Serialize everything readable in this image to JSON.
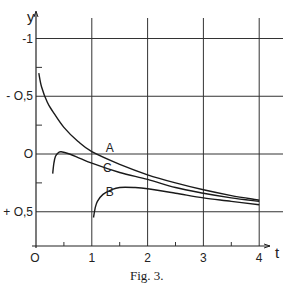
{
  "chart_data": {
    "type": "line",
    "title": "",
    "caption": "Fig. 3.",
    "xlabel": "t",
    "ylabel": "y",
    "xlim": [
      0,
      4
    ],
    "ylim": [
      -1,
      0.5
    ],
    "y_inverted": true,
    "grid": true,
    "x_ticks": [
      0,
      1,
      2,
      3,
      4
    ],
    "x_tick_labels": [
      "O",
      "1",
      "2",
      "3",
      "4"
    ],
    "x_minor_ticks": [
      0.5,
      1.5,
      2.5,
      3.5
    ],
    "y_ticks": [
      -1,
      -0.5,
      0,
      0.5
    ],
    "y_tick_labels": [
      "-1",
      "- O,5",
      "O",
      "+ O,5"
    ],
    "y_minor_ticks": [
      -0.75,
      -0.25,
      0.25
    ],
    "series": [
      {
        "name": "A",
        "x": [
          0.05,
          0.1,
          0.2,
          0.3,
          0.5,
          0.75,
          1.0,
          1.5,
          2.0,
          2.5,
          3.0,
          3.5,
          4.0
        ],
        "y": [
          -0.7,
          -0.58,
          -0.45,
          -0.37,
          -0.23,
          -0.11,
          -0.02,
          0.09,
          0.18,
          0.25,
          0.31,
          0.36,
          0.4
        ]
      },
      {
        "name": "C",
        "x": [
          0.3,
          0.32,
          0.35,
          0.4,
          0.45,
          0.6,
          0.8,
          1.0,
          1.5,
          2.0,
          2.5,
          3.0,
          3.5,
          4.0
        ],
        "y": [
          0.17,
          0.08,
          0.02,
          -0.01,
          -0.02,
          0.0,
          0.04,
          0.08,
          0.16,
          0.22,
          0.29,
          0.34,
          0.38,
          0.41
        ]
      },
      {
        "name": "B",
        "x": [
          1.03,
          1.06,
          1.1,
          1.2,
          1.35,
          1.5,
          1.75,
          2.0,
          2.5,
          3.0,
          3.5,
          4.0
        ],
        "y": [
          0.55,
          0.47,
          0.41,
          0.35,
          0.31,
          0.29,
          0.29,
          0.3,
          0.34,
          0.38,
          0.41,
          0.44
        ]
      }
    ],
    "annotations": [
      {
        "text": "A",
        "x": 1.25,
        "y": -0.05
      },
      {
        "text": "C",
        "x": 1.2,
        "y": 0.12
      },
      {
        "text": "B",
        "x": 1.25,
        "y": 0.33
      }
    ]
  }
}
